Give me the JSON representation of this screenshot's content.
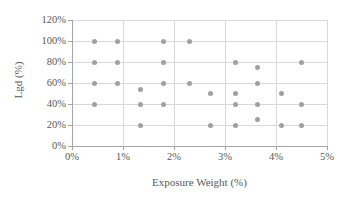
{
  "chart_data": {
    "type": "scatter",
    "title": "",
    "xlabel": "Exposure Weight (%)",
    "ylabel": "Lgd (%)",
    "xlim": [
      0,
      5
    ],
    "ylim": [
      0,
      120
    ],
    "grid": true,
    "legend": false,
    "marker_color": "#a0a0a0",
    "axis_color": "#a6a6a6",
    "grid_color": "#d9d9d9",
    "text_color": "#595959",
    "xticks": [
      "0%",
      "1%",
      "2%",
      "3%",
      "4%",
      "5%"
    ],
    "xtick_values": [
      0,
      1,
      2,
      3,
      4,
      5
    ],
    "yticks": [
      "0%",
      "20%",
      "40%",
      "60%",
      "80%",
      "100%",
      "120%"
    ],
    "ytick_values": [
      0,
      20,
      40,
      60,
      80,
      100,
      120
    ],
    "series": [
      {
        "name": "Exposure vs Lgd",
        "points": [
          [
            0.45,
            100
          ],
          [
            0.9,
            100
          ],
          [
            1.8,
            100
          ],
          [
            2.3,
            100
          ],
          [
            0.45,
            80
          ],
          [
            0.9,
            80
          ],
          [
            1.8,
            80
          ],
          [
            3.2,
            80
          ],
          [
            4.5,
            80
          ],
          [
            3.63,
            75
          ],
          [
            0.45,
            60
          ],
          [
            0.9,
            60
          ],
          [
            1.8,
            60
          ],
          [
            2.3,
            60
          ],
          [
            3.63,
            60
          ],
          [
            1.35,
            54
          ],
          [
            2.72,
            50
          ],
          [
            3.2,
            50
          ],
          [
            4.1,
            50
          ],
          [
            0.45,
            40
          ],
          [
            1.35,
            40
          ],
          [
            1.8,
            40
          ],
          [
            3.2,
            40
          ],
          [
            3.63,
            40
          ],
          [
            4.5,
            40
          ],
          [
            3.63,
            25
          ],
          [
            1.35,
            20
          ],
          [
            2.72,
            20
          ],
          [
            3.2,
            20
          ],
          [
            4.1,
            20
          ],
          [
            4.5,
            20
          ]
        ]
      }
    ]
  }
}
